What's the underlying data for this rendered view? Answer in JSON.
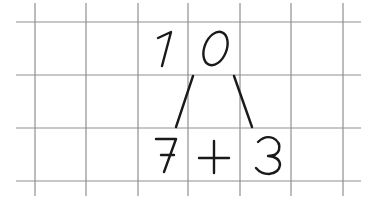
{
  "figure": {
    "whole": "10",
    "whole_digits": [
      "1",
      "0"
    ],
    "parts": [
      "7",
      "3"
    ],
    "operator": "+",
    "expression": "7 + 3"
  },
  "grid": {
    "vertical_x": [
      35,
      86,
      138,
      188,
      240,
      291,
      343
    ],
    "horizontal_y": [
      22,
      75,
      128,
      181
    ],
    "line_color": "#8a8a8a",
    "ink_color": "#1a1a1a"
  }
}
